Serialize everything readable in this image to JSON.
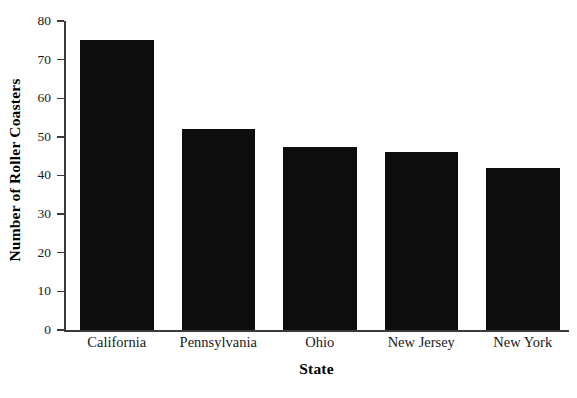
{
  "chart_data": {
    "type": "bar",
    "title": "",
    "xlabel": "State",
    "ylabel": "Number of Roller Coasters",
    "categories": [
      "California",
      "Pennsylvania",
      "Ohio",
      "New Jersey",
      "New York"
    ],
    "values": [
      75,
      52,
      47.5,
      46,
      42
    ],
    "ylim": [
      0,
      80
    ],
    "yticks": [
      0,
      10,
      20,
      30,
      40,
      50,
      60,
      70,
      80
    ],
    "ytick_labels": [
      "0",
      "10",
      "20",
      "30",
      "40",
      "50",
      "60",
      "70",
      "80"
    ],
    "grid": false,
    "legend": null,
    "bar_color": "#0d0d0d",
    "axis_color": "#3a3a3a",
    "background_color": "#ffffff",
    "orientation": "vertical"
  }
}
